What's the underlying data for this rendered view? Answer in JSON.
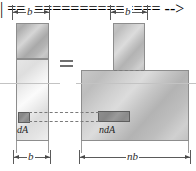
{
  "figure": {
    "kind": "transformed-section-diagram",
    "background": "#ffffff",
    "relation_symbol": "="
  },
  "dimensions": {
    "top_left": {
      "label": "b",
      "x": 12,
      "y": 6,
      "width": 38
    },
    "top_right": {
      "label": "b",
      "x": 110,
      "y": 6,
      "width": 38
    },
    "bottom_left": {
      "label": "b",
      "x": 12,
      "y": 150,
      "width": 38
    },
    "bottom_right": {
      "label": "nb",
      "x": 79,
      "y": 150,
      "width": 110
    }
  },
  "left_section": {
    "name": "original-section",
    "upper_label": "",
    "lower_label": "",
    "element": {
      "label": "dA",
      "caption": "dA"
    }
  },
  "right_section": {
    "name": "transformed-section",
    "web_label": "",
    "flange_label": "",
    "element": {
      "label": "ndA",
      "caption": "ndA"
    }
  },
  "colors": {
    "outline": "#8d8d8d",
    "element_fill": "#8e8e8e",
    "element_outline": "#5e5e5e",
    "dimension": "#5a5a5a",
    "axis": "#c3c3c3",
    "dash": "#7a7a7a",
    "text": "#262626"
  }
}
